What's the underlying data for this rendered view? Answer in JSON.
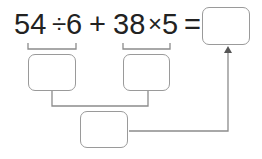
{
  "expression": {
    "tokens": [
      "54",
      "÷",
      "6",
      "+",
      "38",
      "×",
      "5",
      "="
    ]
  },
  "boxes": {
    "result": "",
    "left_sub": "",
    "right_sub": "",
    "sum": ""
  },
  "colors": {
    "text": "#222222",
    "lines": "#8c8c8c",
    "box_border": "#9a9a9a"
  }
}
